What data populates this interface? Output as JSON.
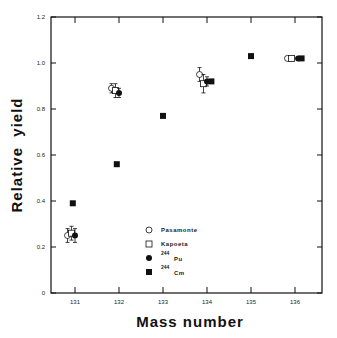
{
  "chart_data": {
    "type": "scatter",
    "title": "",
    "xlabel": "Mass number",
    "ylabel": "Relative  yield",
    "xlim": [
      130.5,
      136.7
    ],
    "ylim": [
      0,
      1.2
    ],
    "x_ticks": [
      "131",
      "132",
      "133",
      "134",
      "135",
      "136"
    ],
    "y_ticks": [
      "0",
      "0.2",
      "0.4",
      "0.6",
      "0.8",
      "1.0",
      "1.2"
    ],
    "grid": false,
    "legend_position": "lower-center-inside",
    "series": [
      {
        "name": "Pasamonte",
        "marker": "open-circle",
        "points": [
          {
            "x": 131,
            "y": 0.25,
            "err": 0.03,
            "dx": -0.17
          },
          {
            "x": 132,
            "y": 0.89,
            "err": 0.02,
            "dx": -0.17
          },
          {
            "x": 134,
            "y": 0.95,
            "err": 0.03,
            "dx": -0.17
          },
          {
            "x": 136,
            "y": 1.02,
            "err": 0,
            "dx": -0.17
          }
        ]
      },
      {
        "name": "Kapoeta",
        "marker": "open-square",
        "points": [
          {
            "x": 131,
            "y": 0.26,
            "err": 0.03,
            "dx": -0.08
          },
          {
            "x": 132,
            "y": 0.88,
            "err": 0.03,
            "dx": -0.08
          },
          {
            "x": 134,
            "y": 0.91,
            "err": 0.04,
            "dx": -0.08
          },
          {
            "x": 136,
            "y": 1.02,
            "err": 0,
            "dx": -0.08
          }
        ]
      },
      {
        "name": "244 Pu",
        "marker": "filled-circle",
        "points": [
          {
            "x": 131,
            "y": 0.25,
            "err": 0.03,
            "dx": 0.0
          },
          {
            "x": 132,
            "y": 0.87,
            "err": 0.02,
            "dx": 0.0
          },
          {
            "x": 134,
            "y": 0.92,
            "err": 0.02,
            "dx": 0.0
          },
          {
            "x": 136,
            "y": 1.02,
            "err": 0,
            "dx": 0.07
          }
        ]
      },
      {
        "name": "244 Cm",
        "marker": "filled-square",
        "points": [
          {
            "x": 130.95,
            "y": 0.39
          },
          {
            "x": 131.95,
            "y": 0.56
          },
          {
            "x": 133.0,
            "y": 0.77
          },
          {
            "x": 134.1,
            "y": 0.92
          },
          {
            "x": 135.0,
            "y": 1.03
          },
          {
            "x": 136.15,
            "y": 1.02
          }
        ]
      }
    ]
  },
  "legend": [
    {
      "symbol": "open-circle",
      "label": "Pasamonte"
    },
    {
      "symbol": "open-square",
      "label": "Kapoeta"
    },
    {
      "symbol": "filled-circle",
      "sup": "244",
      "label": "Pu"
    },
    {
      "symbol": "filled-square",
      "sup": "244",
      "label": "Cm"
    }
  ],
  "axes": {
    "x_title": "Mass number",
    "y_title": "Relative  yield"
  },
  "colors": {
    "ink": "#111111",
    "background": "#ffffff"
  }
}
